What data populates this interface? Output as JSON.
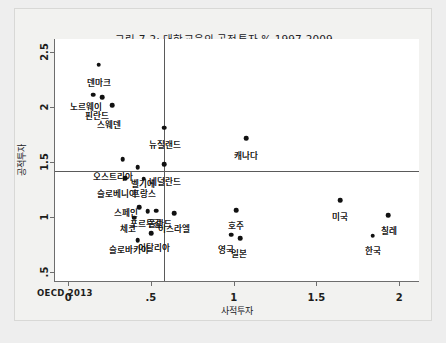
{
  "figure": {
    "title": "그림 7-2: 대학교육의 공적투자 % 1997-2009",
    "source_note": "OECD 2013"
  },
  "chart_data": {
    "type": "scatter",
    "title": "그림 7-2: 대학교육의 공적투자 % 1997-2009",
    "xlabel": "사적투자",
    "ylabel": "공적투자",
    "xlim": [
      -0.08,
      2.12
    ],
    "ylim": [
      0.42,
      2.62
    ],
    "xticks": [
      0,
      0.5,
      1,
      1.5,
      2
    ],
    "xticklabels": [
      "0",
      ".5",
      "1",
      "1.5",
      "2"
    ],
    "yticks": [
      0.5,
      1,
      1.5,
      2,
      2.5
    ],
    "yticklabels": [
      ".5",
      "1",
      "1.5",
      "2",
      "2.5"
    ],
    "grid": false,
    "legend": null,
    "reference_lines": {
      "vertical_x": 0.58,
      "horizontal_y": 1.42
    },
    "points": [
      {
        "label": "덴마크",
        "x": 0.185,
        "y": 2.385,
        "lx": 0.185,
        "ly": 2.255
      },
      {
        "label": "노르웨이",
        "x": 0.15,
        "y": 2.115,
        "lx": 0.11,
        "ly": 2.035
      },
      {
        "label": "핀란드",
        "x": 0.205,
        "y": 2.09,
        "lx": 0.175,
        "ly": 1.96
      },
      {
        "label": "스웨덴",
        "x": 0.265,
        "y": 2.02,
        "lx": 0.245,
        "ly": 1.875
      },
      {
        "label": "뉴질랜드",
        "x": 0.58,
        "y": 1.815,
        "lx": 0.585,
        "ly": 1.69
      },
      {
        "label": "캐나다",
        "x": 1.075,
        "y": 1.72,
        "lx": 1.075,
        "ly": 1.595
      },
      {
        "label": "네덜란드",
        "x": 0.58,
        "y": 1.48,
        "lx": 0.585,
        "ly": 1.355
      },
      {
        "label": "오스트리아",
        "x": 0.33,
        "y": 1.525,
        "lx": 0.27,
        "ly": 1.405
      },
      {
        "label": "벨기에",
        "x": 0.42,
        "y": 1.455,
        "lx": 0.45,
        "ly": 1.335
      },
      {
        "label": "슬로베니아",
        "x": 0.345,
        "y": 1.355,
        "lx": 0.295,
        "ly": 1.245
      },
      {
        "label": "프랑스",
        "x": 0.455,
        "y": 1.35,
        "lx": 0.455,
        "ly": 1.245
      },
      {
        "label": "스페인",
        "x": 0.43,
        "y": 1.09,
        "lx": 0.35,
        "ly": 1.075
      },
      {
        "label": "포르투갈",
        "x": 0.48,
        "y": 1.055,
        "lx": 0.47,
        "ly": 0.975
      },
      {
        "label": "폴란드",
        "x": 0.53,
        "y": 1.06,
        "lx": 0.555,
        "ly": 0.975
      },
      {
        "label": "체코",
        "x": 0.4,
        "y": 0.995,
        "lx": 0.36,
        "ly": 0.93
      },
      {
        "label": "이스라엘",
        "x": 0.64,
        "y": 1.035,
        "lx": 0.64,
        "ly": 0.93
      },
      {
        "label": "호주",
        "x": 1.015,
        "y": 1.065,
        "lx": 1.015,
        "ly": 0.96
      },
      {
        "label": "미국",
        "x": 1.645,
        "y": 1.155,
        "lx": 1.645,
        "ly": 1.04
      },
      {
        "label": "칠레",
        "x": 1.935,
        "y": 1.02,
        "lx": 1.94,
        "ly": 0.915
      },
      {
        "label": "이탈리아",
        "x": 0.5,
        "y": 0.855,
        "lx": 0.52,
        "ly": 0.76
      },
      {
        "label": "슬로바키아",
        "x": 0.42,
        "y": 0.79,
        "lx": 0.37,
        "ly": 0.735
      },
      {
        "label": "영국",
        "x": 0.985,
        "y": 0.84,
        "lx": 0.955,
        "ly": 0.74
      },
      {
        "label": "일본",
        "x": 1.04,
        "y": 0.81,
        "lx": 1.035,
        "ly": 0.7
      },
      {
        "label": "한국",
        "x": 1.84,
        "y": 0.83,
        "lx": 1.84,
        "ly": 0.725
      }
    ]
  }
}
